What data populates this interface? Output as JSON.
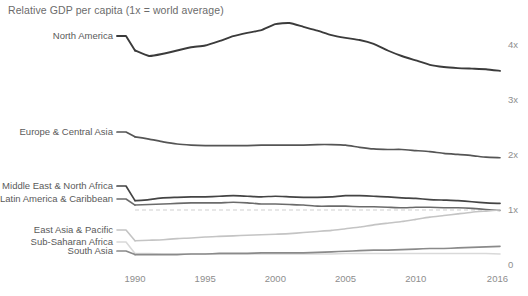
{
  "chart_data": {
    "type": "line",
    "title": "Relative GDP per capita (1x = world average)",
    "xlabel": "",
    "ylabel": "",
    "xlim": [
      1990,
      2016
    ],
    "ylim": [
      0,
      4.45
    ],
    "grid": "dashed-reference-line-at-1x",
    "reference_line": 1,
    "legend_position": "inline-left-labels",
    "x": [
      1990,
      1991,
      1992,
      1993,
      1994,
      1995,
      1996,
      1997,
      1998,
      1999,
      2000,
      2001,
      2002,
      2003,
      2004,
      2005,
      2006,
      2007,
      2008,
      2009,
      2010,
      2011,
      2012,
      2013,
      2014,
      2015,
      2016
    ],
    "xticks": [
      "1990",
      "1995",
      "2000",
      "2005",
      "2010",
      "2016"
    ],
    "yticks": [
      "0",
      "1x",
      "2x",
      "3x",
      "4x"
    ],
    "ytick_values": [
      0,
      1,
      2,
      3,
      4
    ],
    "series": [
      {
        "name": "North America",
        "color": "#3b3b3b",
        "width": 1.9,
        "label_y": 40,
        "values": [
          3.9,
          3.8,
          3.84,
          3.9,
          3.96,
          3.99,
          4.07,
          4.16,
          4.22,
          4.27,
          4.38,
          4.4,
          4.33,
          4.26,
          4.18,
          4.13,
          4.09,
          4.02,
          3.9,
          3.8,
          3.72,
          3.64,
          3.6,
          3.58,
          3.57,
          3.56,
          3.53
        ]
      },
      {
        "name": "Europe & Central Asia",
        "color": "#555555",
        "width": 1.7,
        "label_y": 136,
        "values": [
          2.33,
          2.29,
          2.24,
          2.2,
          2.18,
          2.17,
          2.17,
          2.17,
          2.17,
          2.18,
          2.18,
          2.18,
          2.18,
          2.19,
          2.19,
          2.18,
          2.14,
          2.11,
          2.1,
          2.1,
          2.08,
          2.06,
          2.03,
          2.01,
          1.99,
          1.96,
          1.95
        ]
      },
      {
        "name": "Middle East & North Africa",
        "color": "#444444",
        "width": 1.7,
        "label_y": 190,
        "values": [
          1.17,
          1.19,
          1.22,
          1.23,
          1.24,
          1.24,
          1.25,
          1.26,
          1.25,
          1.24,
          1.25,
          1.24,
          1.23,
          1.23,
          1.24,
          1.26,
          1.26,
          1.25,
          1.24,
          1.22,
          1.21,
          1.19,
          1.18,
          1.17,
          1.15,
          1.13,
          1.12
        ]
      },
      {
        "name": "Latin America & Caribbean",
        "color": "#6b6b6b",
        "width": 1.6,
        "label_y": 203,
        "values": [
          1.09,
          1.1,
          1.11,
          1.12,
          1.13,
          1.13,
          1.13,
          1.14,
          1.13,
          1.11,
          1.11,
          1.1,
          1.09,
          1.07,
          1.07,
          1.07,
          1.06,
          1.06,
          1.05,
          1.04,
          1.05,
          1.05,
          1.04,
          1.04,
          1.03,
          1.01,
          0.99
        ]
      },
      {
        "name": "East Asia & Pacific",
        "color": "#c4c4c4",
        "width": 1.6,
        "label_y": 234,
        "values": [
          0.44,
          0.45,
          0.46,
          0.48,
          0.49,
          0.51,
          0.52,
          0.53,
          0.54,
          0.55,
          0.56,
          0.57,
          0.59,
          0.61,
          0.63,
          0.66,
          0.69,
          0.73,
          0.76,
          0.79,
          0.83,
          0.87,
          0.9,
          0.93,
          0.96,
          0.98,
          1.0
        ]
      },
      {
        "name": "Sub-Saharan Africa",
        "color": "#d9d9d9",
        "width": 1.6,
        "label_y": 246,
        "values": [
          0.21,
          0.21,
          0.2,
          0.2,
          0.2,
          0.2,
          0.2,
          0.2,
          0.2,
          0.2,
          0.2,
          0.2,
          0.2,
          0.2,
          0.2,
          0.21,
          0.21,
          0.21,
          0.21,
          0.21,
          0.21,
          0.21,
          0.21,
          0.21,
          0.21,
          0.21,
          0.2
        ]
      },
      {
        "name": "South Asia",
        "color": "#8a8a8a",
        "width": 1.7,
        "label_y": 255,
        "values": [
          0.19,
          0.19,
          0.19,
          0.19,
          0.2,
          0.2,
          0.21,
          0.21,
          0.21,
          0.22,
          0.22,
          0.22,
          0.22,
          0.23,
          0.24,
          0.25,
          0.26,
          0.27,
          0.27,
          0.28,
          0.29,
          0.3,
          0.3,
          0.31,
          0.32,
          0.33,
          0.34
        ]
      }
    ]
  }
}
